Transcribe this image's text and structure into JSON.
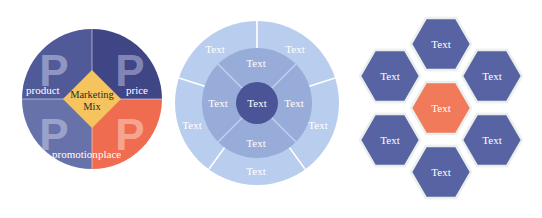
{
  "marketing_mix": {
    "center_label_line1": "Marketing",
    "center_label_line2": "Mix",
    "quadrants": [
      {
        "id": "product",
        "letter": "P",
        "label": "product",
        "color": "#505a98"
      },
      {
        "id": "price",
        "letter": "P",
        "label": "price",
        "color": "#3f4585"
      },
      {
        "id": "promotion",
        "letter": "P",
        "label": "promotion",
        "color": "#6872aa"
      },
      {
        "id": "place",
        "letter": "P",
        "label": "place",
        "color": "#ef6c50"
      }
    ],
    "diamond_color": "#f6c45e"
  },
  "concentric": {
    "center": {
      "label": "Text",
      "color": "#4a5496"
    },
    "inner_ring": {
      "color": "#97acd8",
      "segments": [
        {
          "label": "Text"
        },
        {
          "label": "Text"
        },
        {
          "label": "Text"
        },
        {
          "label": "Text"
        }
      ]
    },
    "outer_ring": {
      "color": "#b9cdee",
      "segments": [
        {
          "label": "Text"
        },
        {
          "label": "Text"
        },
        {
          "label": "Text"
        },
        {
          "label": "Text"
        },
        {
          "label": "Text"
        }
      ]
    }
  },
  "hexagons": {
    "center": {
      "label": "Text",
      "color": "#f07a5a"
    },
    "surrounding_color": "#5763a2",
    "items": [
      {
        "position": "top",
        "label": "Text"
      },
      {
        "position": "upper-right",
        "label": "Text"
      },
      {
        "position": "lower-right",
        "label": "Text"
      },
      {
        "position": "bottom",
        "label": "Text"
      },
      {
        "position": "lower-left",
        "label": "Text"
      },
      {
        "position": "upper-left",
        "label": "Text"
      }
    ]
  }
}
